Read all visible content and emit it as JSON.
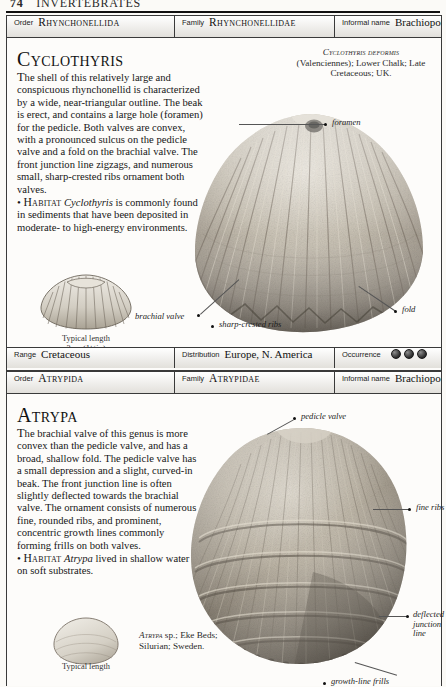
{
  "running_head": {
    "folio": "74",
    "title": "INVERTEBRATES"
  },
  "entries": [
    {
      "id": "cyclothyris",
      "taxonomy": {
        "order_key": "Order",
        "order_value": "Rhynchonellida",
        "family_key": "Family",
        "family_value": "Rhynchonellidae",
        "informal_key": "Informal name",
        "informal_value": "Brachiopod"
      },
      "genus": "Cyclothyris",
      "description_html": "<span class=\"dropstart\">T</span>he shell of this relatively large and conspicuous rhynchonellid is characterized by a wide, near-triangular outline. The beak is erect, and contains a large hole (foramen) for the pedicle. Both valves are convex, with a pronounced sulcus on the pedicle valve and a fold on the brachial valve. The front junction line zigzags, and numerous small, sharp-crested ribs ornament both valves.<br><span class=\"bullet\">•</span> <span class=\"habitat\">Habitat</span> <i>Cyclothyris</i> is commonly found in sediments that have been deposited in moderate- to high-energy environments.",
      "specimen_caption": {
        "species": "Cyclothyris deformis",
        "rest": "(Valenciennes); Lower Chalk; Late Cretaceous; UK."
      },
      "callouts": [
        {
          "label": "foramen"
        },
        {
          "label": "brachial valve"
        },
        {
          "label": "sharp-crested ribs"
        },
        {
          "label": "fold"
        }
      ],
      "typical_length": {
        "line1": "Typical length",
        "line2": "3cm (1¼in)"
      },
      "footer": {
        "range_key": "Range",
        "range_value": "Cretaceous",
        "distribution_key": "Distribution",
        "distribution_value": "Europe, N. America",
        "occurrence_key": "Occurrence",
        "occurrence_count": 3
      }
    },
    {
      "id": "atrypa",
      "taxonomy": {
        "order_key": "Order",
        "order_value": "Atrypida",
        "family_key": "Family",
        "family_value": "Atrypidae",
        "informal_key": "Informal name",
        "informal_value": "Brachiopod"
      },
      "genus": "Atrypa",
      "description_html": "<span class=\"dropstart\">T</span>he brachial valve of this genus is more convex than the pedicle valve, and has a broad, shallow fold. The pedicle valve has a small depression and a slight, curved-in beak. The front junction line is often slightly deflected towards the brachial valve. The ornament consists of numerous fine, rounded ribs, and prominent, concentric growth lines commonly forming frills on both valves.<br><span class=\"bullet\">•</span> <span class=\"habitat\">Habitat</span> <i>Atrypa</i> lived in shallow water on soft substrates.",
      "specimen_caption": {
        "species": "Atrypa",
        "rest": "sp.; Eke Beds; Silurian; Sweden."
      },
      "callouts": [
        {
          "label": "pedicle valve"
        },
        {
          "label": "fine ribs"
        },
        {
          "label": "deflected junction line"
        },
        {
          "label": "growth-line frills"
        }
      ],
      "typical_length": {
        "line1": "Typical length",
        "line2": ""
      }
    }
  ],
  "colors": {
    "page_background": "#fbfaf7",
    "rule": "#111111",
    "frame": "#3a3a3a",
    "text": "#161616",
    "occurrence_dot": "#2b2b2b"
  }
}
